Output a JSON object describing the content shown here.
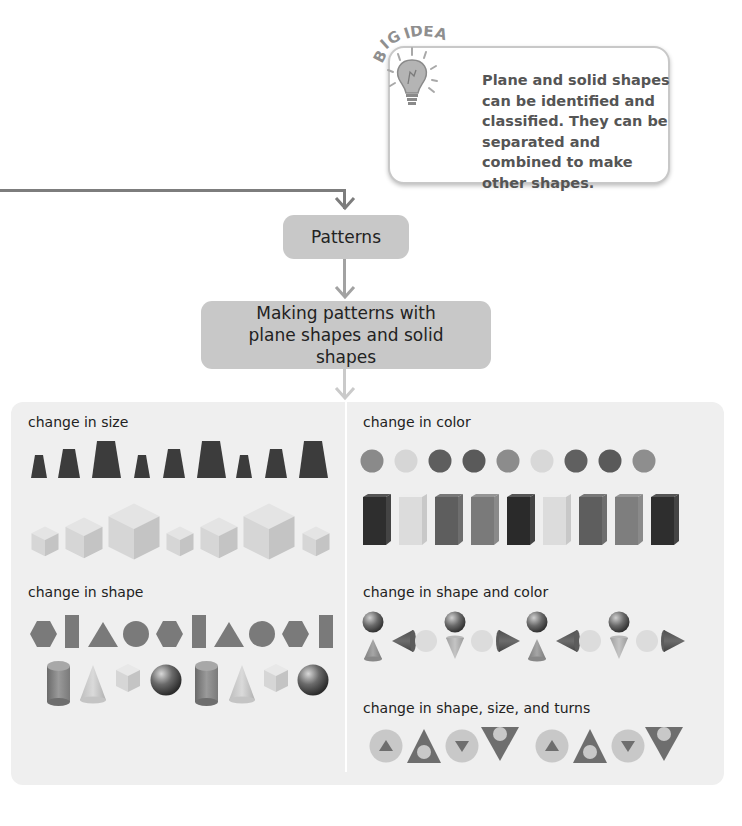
{
  "big_idea": {
    "badge_text": "BIG IDEA",
    "badge_icon": "lightbulb-icon",
    "text": "Plane and solid shapes can be identified and classified. They can be separated and combined to make other shapes."
  },
  "flow": {
    "nodes": [
      {
        "label": "Patterns"
      },
      {
        "label": "Making patterns with plane shapes and solid shapes"
      }
    ]
  },
  "panel": {
    "sections": [
      {
        "label": "change in size",
        "rows": [
          {
            "shape": "trapezoid",
            "color": "#3c3c3c",
            "sizes": [
              "small",
              "medium",
              "large",
              "small",
              "medium",
              "large",
              "small",
              "medium",
              "large"
            ]
          },
          {
            "shape": "cube",
            "color": "#d7d7d7",
            "sizes": [
              "small",
              "medium",
              "large",
              "small",
              "medium",
              "large",
              "small"
            ]
          }
        ]
      },
      {
        "label": "change in color",
        "rows": [
          {
            "shape": "circle",
            "colors": [
              "#8a8a8a",
              "#d6d6d6",
              "#5e5e5e",
              "#5a5a5a",
              "#8c8c8c",
              "#d8d8d8",
              "#606060",
              "#5a5a5a",
              "#8e8e8e"
            ]
          },
          {
            "shape": "rectangular-prism",
            "colors": [
              "#2e2e2e",
              "#dcdcdc",
              "#5e5e5e",
              "#7a7a7a",
              "#2a2a2a",
              "#dcdcdc",
              "#5e5e5e",
              "#7e7e7e",
              "#2e2e2e"
            ]
          }
        ]
      },
      {
        "label": "change in shape",
        "rows": [
          {
            "shape_sequence": [
              "hexagon",
              "rectangle",
              "triangle",
              "circle",
              "hexagon",
              "rectangle",
              "triangle",
              "circle",
              "hexagon",
              "rectangle"
            ],
            "color": "#7a7a7a"
          },
          {
            "shape_sequence": [
              "cylinder",
              "cone",
              "cube",
              "sphere",
              "cylinder",
              "cone",
              "cube",
              "sphere"
            ]
          }
        ]
      },
      {
        "label": "change in shape and color",
        "rows": [
          {
            "shape_sequence": [
              "sphere-over-cone-up",
              "cone-left-and-circle",
              "sphere-over-cone-down",
              "circle-and-cone-right",
              "sphere-over-cone-up",
              "cone-left-and-circle",
              "sphere-over-cone-down",
              "circle-and-cone-right"
            ]
          }
        ]
      },
      {
        "label": "change in shape, size, and turns",
        "rows": [
          {
            "shape_sequence": [
              "circle-with-small-triangle-up",
              "large-triangle-up-with-circle",
              "circle-with-small-triangle-down",
              "large-triangle-down-with-circle",
              "circle-with-small-triangle-up",
              "large-triangle-up-with-circle",
              "circle-with-small-triangle-down",
              "large-triangle-down-with-circle"
            ]
          }
        ]
      }
    ]
  },
  "colors": {
    "node_fill": "#c8c8c8",
    "panel_fill": "#efefef",
    "connector_dark": "#7d7d7d",
    "connector_light": "#c4c4c4",
    "callout_text": "#555555"
  }
}
